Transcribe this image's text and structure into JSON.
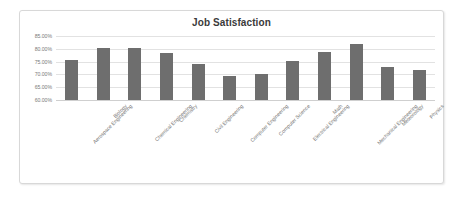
{
  "chart_data": {
    "type": "bar",
    "title": "Job Satisfaction",
    "xlabel": "",
    "ylabel": "",
    "ylim": [
      60,
      85
    ],
    "grid": true,
    "legend": "none",
    "y_tick_labels": [
      "85.00%",
      "80.00%",
      "75.00%",
      "70.00%",
      "65.00%",
      "60.00%"
    ],
    "y_tick_values": [
      85,
      80,
      75,
      70,
      65,
      60
    ],
    "categories": [
      "Aerospace Engineering",
      "Biology",
      "Chemical Engineering",
      "Chemistry",
      "Civil Engineering",
      "Computer Engineering",
      "Computer Science",
      "Electrical Engineering",
      "Math",
      "Mechanical Engineering",
      "Meteorology",
      "Physics"
    ],
    "values": [
      75.8,
      80.5,
      80.3,
      78.5,
      74.0,
      69.3,
      70.0,
      75.2,
      78.9,
      82.0,
      72.8,
      71.6
    ],
    "bar_color": "#6e6e6e",
    "gridline_color": "#e2e2e2",
    "plot_background": "#ffffff"
  }
}
